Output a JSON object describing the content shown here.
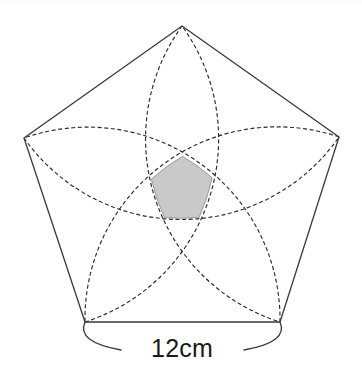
{
  "figure": {
    "kind": "geometry-diagram",
    "background_color": "#ffffff",
    "canvas": {
      "width": 362,
      "height": 378
    }
  },
  "pentagon": {
    "name": "regular-pentagon",
    "sides": 5,
    "side_length_value": "12",
    "side_length_unit": "cm",
    "stroke_color": "#3a3a3a",
    "stroke_width": "1.3",
    "fill": "none",
    "center": {
      "x": 182,
      "y": 179
    },
    "circumradius": 156,
    "vertices": [
      {
        "label": "top",
        "x": 182,
        "y": 26
      },
      {
        "x": 339,
        "y": 137
      },
      {
        "x": 280,
        "y": 322
      },
      {
        "x": 85,
        "y": 322
      },
      {
        "x": 24,
        "y": 138
      }
    ]
  },
  "arcs": {
    "name": "vertex-centered-arcs",
    "count": 5,
    "description": "Each arc is centered on a pentagon vertex with radius equal to the pentagon side, drawn between the two adjacent vertices.",
    "stroke_color": "#2b2b2b",
    "stroke_width": "1.15",
    "dash_pattern": "4 2.6",
    "fill": "none"
  },
  "shaded_region": {
    "name": "central-overlap-region",
    "description": "Curved pentagon formed where all five arcs overlap at the centre.",
    "fill_color": "#c9c9c9",
    "stroke_color": "#8a8a8a",
    "stroke_width": "0.8",
    "approx_bounds": {
      "x": 150,
      "y": 159,
      "width": 68,
      "height": 57
    }
  },
  "dimension": {
    "name": "bottom-side-dimension",
    "label_text": "12cm",
    "label_x": 182,
    "label_y": 357,
    "font_size": 25,
    "text_color": "#1a1a1a",
    "leader_stroke_color": "#3a3a3a",
    "leader_stroke_width": "1.3",
    "measures_edge": "bottom",
    "edge_from": {
      "x": 85,
      "y": 322
    },
    "edge_to": {
      "x": 280,
      "y": 322
    }
  }
}
